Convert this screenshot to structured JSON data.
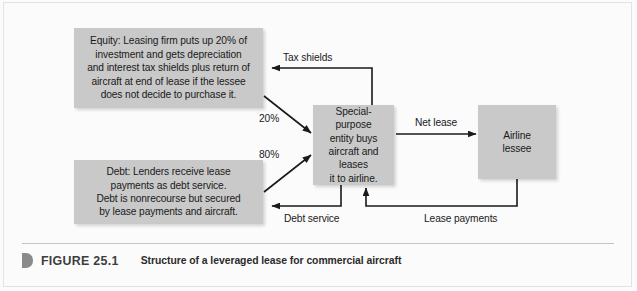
{
  "figure": {
    "marker_icon": "caption-marker-icon",
    "number_label": "FIGURE 25.1",
    "title": "Structure of a leveraged lease for commercial aircraft"
  },
  "diagram": {
    "type": "flow-diagram",
    "nodes": [
      {
        "id": "equity",
        "label": "Equity: Leasing firm puts up 20% of\ninvestment and gets depreciation\nand interest tax shields plus return of\naircraft at end of lease if the lessee\ndoes not decide to purchase it."
      },
      {
        "id": "debt",
        "label": "Debt: Lenders receive lease\npayments as debt service.\nDebt is nonrecourse but secured\nby lease payments and aircraft."
      },
      {
        "id": "spe",
        "label": "Special-purpose\nentity buys\naircraft and leases\nit to airline."
      },
      {
        "id": "airline",
        "label": "Airline\nlessee"
      }
    ],
    "edges": [
      {
        "id": "tax-shields",
        "label": "Tax shields",
        "from": "spe",
        "to": "equity"
      },
      {
        "id": "equity-share",
        "label": "20%",
        "from": "equity",
        "to": "spe"
      },
      {
        "id": "debt-share",
        "label": "80%",
        "from": "debt",
        "to": "spe"
      },
      {
        "id": "net-lease",
        "label": "Net lease",
        "from": "spe",
        "to": "airline"
      },
      {
        "id": "debt-service",
        "label": "Debt service",
        "from": "spe",
        "to": "debt"
      },
      {
        "id": "lease-payments",
        "label": "Lease payments",
        "from": "airline",
        "to": "spe"
      }
    ],
    "colors": {
      "node_fill": "#c9c9c9",
      "text": "#1a1a1a",
      "arrow": "#1a1a1a",
      "background": "#fbfbfb"
    }
  }
}
